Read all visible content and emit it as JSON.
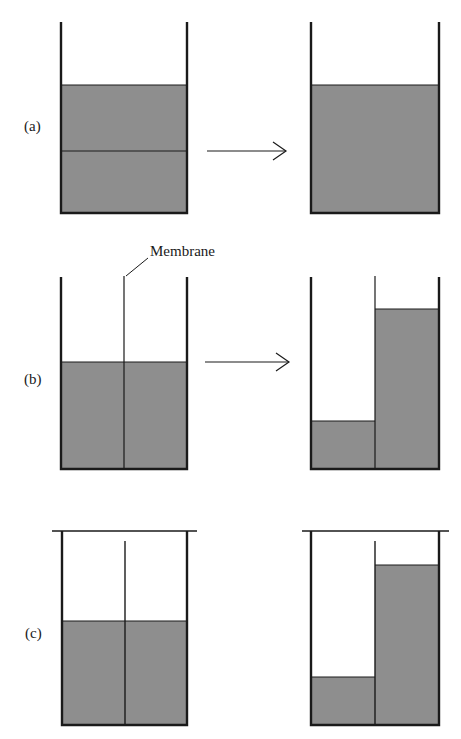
{
  "figure": {
    "rows": [
      {
        "id": "a",
        "label": "(a)"
      },
      {
        "id": "b",
        "label": "(b)"
      },
      {
        "id": "c",
        "label": "(c)"
      }
    ],
    "annotations": {
      "membrane": "Membrane"
    },
    "colors": {
      "fill": "#8e8e8e",
      "line": "#1a1a1a",
      "background": "#ffffff"
    }
  }
}
